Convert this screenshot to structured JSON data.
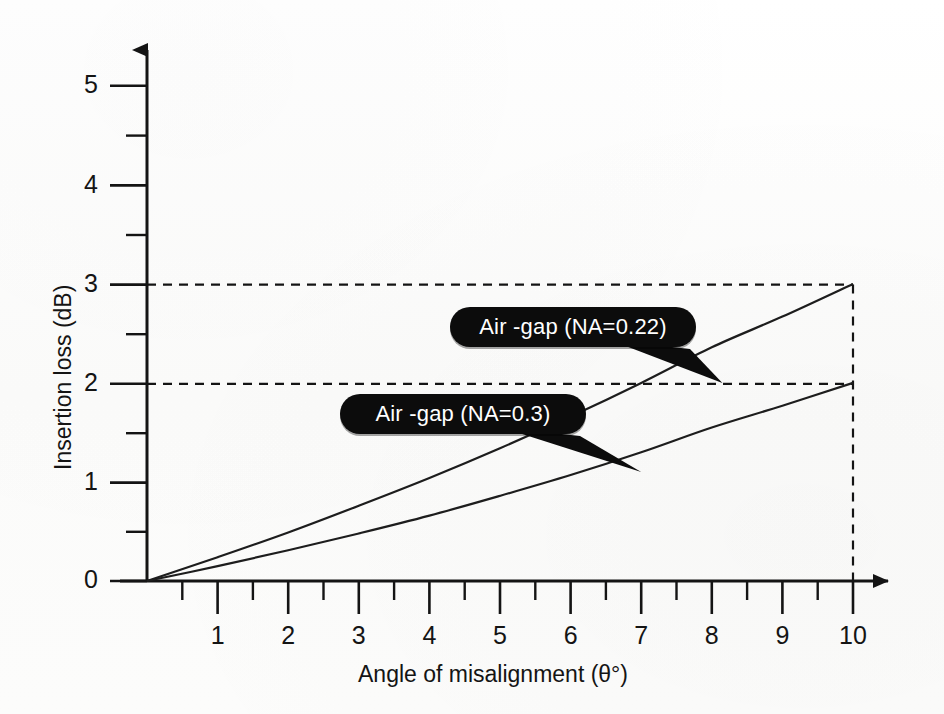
{
  "chart_data": {
    "type": "line",
    "title": "",
    "xlabel": "Angle of misalignment (θ°)",
    "ylabel": "Insertion loss (dB)",
    "xlim": [
      0,
      10
    ],
    "ylim": [
      0,
      5.4
    ],
    "grid": false,
    "legend_position": "inline-callouts",
    "x_ticks": [
      "1",
      "2",
      "3",
      "4",
      "5",
      "6",
      "7",
      "8",
      "9",
      "10"
    ],
    "x_tick_values": [
      1,
      2,
      3,
      4,
      5,
      6,
      7,
      8,
      9,
      10
    ],
    "x_minor_ticks": [
      0.5,
      1.5,
      2.5,
      3.5,
      4.5,
      5.5,
      6.5,
      7.5,
      8.5,
      9.5
    ],
    "y_ticks": [
      "0",
      "1",
      "2",
      "3",
      "4",
      "5"
    ],
    "y_tick_values": [
      0,
      1,
      2,
      3,
      4,
      5
    ],
    "y_minor_ticks": [
      0.5,
      1.5,
      2.5,
      3.5,
      4.5
    ],
    "series": [
      {
        "name": "Air -gap (NA=0.22)",
        "x": [
          0,
          1,
          2,
          3,
          4,
          5,
          6,
          7,
          8,
          9,
          10
        ],
        "values": [
          0,
          0.24,
          0.49,
          0.76,
          1.04,
          1.34,
          1.66,
          2.0,
          2.36,
          2.67,
          3.0
        ]
      },
      {
        "name": "Air -gap (NA=0.3)",
        "x": [
          0,
          1,
          2,
          3,
          4,
          5,
          6,
          7,
          8,
          9,
          10
        ],
        "values": [
          0,
          0.15,
          0.31,
          0.48,
          0.66,
          0.86,
          1.07,
          1.3,
          1.55,
          1.77,
          2.0
        ]
      }
    ],
    "annotations": [
      {
        "label": "Air -gap (NA=0.22)",
        "points_to_series": "Air -gap (NA=0.22)",
        "points_to_x": 8.15,
        "points_to_y": 2.0
      },
      {
        "label": "Air -gap (NA=0.3)",
        "points_to_series": "Air -gap (NA=0.3)",
        "points_to_x": 7.0,
        "points_to_y": 1.1
      }
    ],
    "reference_lines": [
      {
        "orientation": "horizontal",
        "value": 3,
        "style": "dashed"
      },
      {
        "orientation": "horizontal",
        "value": 2,
        "style": "dashed"
      },
      {
        "orientation": "vertical",
        "value": 10,
        "style": "dashed"
      }
    ]
  },
  "axes": {
    "x_label": "Angle of misalignment (θ°)",
    "y_label": "Insertion loss (dB)",
    "x_tick_labels": [
      "1",
      "2",
      "3",
      "4",
      "5",
      "6",
      "7",
      "8",
      "9",
      "10"
    ],
    "y_tick_labels": [
      "0",
      "1",
      "2",
      "3",
      "4",
      "5"
    ]
  },
  "callouts": [
    {
      "text": "Air -gap (NA=0.22)"
    },
    {
      "text": "Air -gap (NA=0.3)"
    }
  ],
  "colors": {
    "ink": "#141414",
    "curve": "#1d1d1d",
    "callout_fill": "#0c0c0c",
    "callout_text": "#ffffff",
    "background": "#fdfdfc"
  }
}
